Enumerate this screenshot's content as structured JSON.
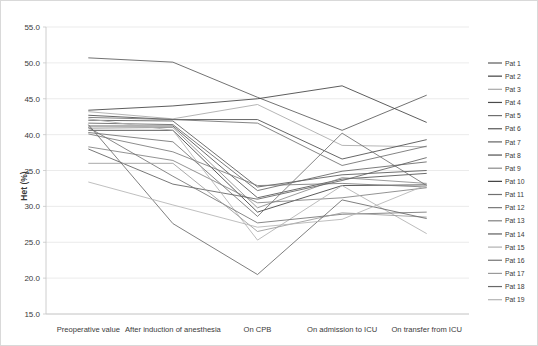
{
  "chart_data": {
    "type": "line",
    "title": "",
    "xlabel": "",
    "ylabel": "Het (%)",
    "ylim": [
      15.0,
      55.0
    ],
    "ytick_step": 5.0,
    "grid": true,
    "legend_position": "right",
    "categories": [
      "Preoperative value",
      "After induction of anesthesia",
      "On CPB",
      "On admission to ICU",
      "On transfer from ICU"
    ],
    "ytick_labels": [
      "15.0",
      "20.0",
      "25.0",
      "30.0",
      "35.0",
      "40.0",
      "45.0",
      "50.0",
      "55.0"
    ],
    "series": [
      {
        "name": "Pat 1",
        "color": "#595959",
        "values": [
          50.7,
          50.1,
          45.2,
          40.6,
          45.5
        ]
      },
      {
        "name": "Pat 2",
        "color": "#404040",
        "values": [
          43.4,
          44.0,
          45.0,
          46.8,
          41.7
        ]
      },
      {
        "name": "Pat 3",
        "color": "#a8a8a8",
        "values": [
          43.2,
          42.2,
          44.2,
          38.5,
          38.3
        ]
      },
      {
        "name": "Pat 4",
        "color": "#4a4a4a",
        "values": [
          42.7,
          42.1,
          42.1,
          36.6,
          39.3
        ]
      },
      {
        "name": "Pat 5",
        "color": "#6e6e6e",
        "values": [
          42.4,
          42.1,
          41.6,
          35.7,
          38.4
        ]
      },
      {
        "name": "Pat 6",
        "color": "#565656",
        "values": [
          42.0,
          41.9,
          32.7,
          34.4,
          35.0
        ]
      },
      {
        "name": "Pat 7",
        "color": "#636363",
        "values": [
          41.6,
          41.4,
          32.2,
          34.9,
          36.2
        ]
      },
      {
        "name": "Pat 8",
        "color": "#4f4f4f",
        "values": [
          41.2,
          41.2,
          31.2,
          33.8,
          34.6
        ]
      },
      {
        "name": "Pat 9",
        "color": "#8a8a8a",
        "values": [
          40.9,
          41.0,
          29.8,
          34.0,
          33.2
        ]
      },
      {
        "name": "Pat 10",
        "color": "#3d3d3d",
        "values": [
          40.6,
          40.6,
          29.2,
          32.9,
          33.0
        ]
      },
      {
        "name": "Pat 11",
        "color": "#707070",
        "values": [
          40.3,
          39.0,
          28.6,
          40.2,
          32.9
        ]
      },
      {
        "name": "Pat 12",
        "color": "#787878",
        "values": [
          40.1,
          37.6,
          32.9,
          33.2,
          32.7
        ]
      },
      {
        "name": "Pat 13",
        "color": "#808080",
        "values": [
          38.3,
          36.4,
          30.5,
          31.2,
          32.6
        ]
      },
      {
        "name": "Pat 14",
        "color": "#5e5e5e",
        "values": [
          38.0,
          33.1,
          31.0,
          33.6,
          36.8
        ]
      },
      {
        "name": "Pat 15",
        "color": "#b0b0b0",
        "values": [
          42.2,
          40.6,
          25.3,
          32.9,
          26.2
        ]
      },
      {
        "name": "Pat 16",
        "color": "#737373",
        "values": [
          41.0,
          34.2,
          27.7,
          28.9,
          29.2
        ]
      },
      {
        "name": "Pat 17",
        "color": "#9a9a9a",
        "values": [
          36.0,
          36.0,
          26.5,
          29.1,
          28.5
        ]
      },
      {
        "name": "Pat 18",
        "color": "#686868",
        "values": [
          41.4,
          27.6,
          20.5,
          30.9,
          28.3
        ]
      },
      {
        "name": "Pat 19",
        "color": "#b4b4b4",
        "values": [
          33.4,
          30.2,
          27.1,
          28.2,
          33.0
        ]
      }
    ]
  }
}
